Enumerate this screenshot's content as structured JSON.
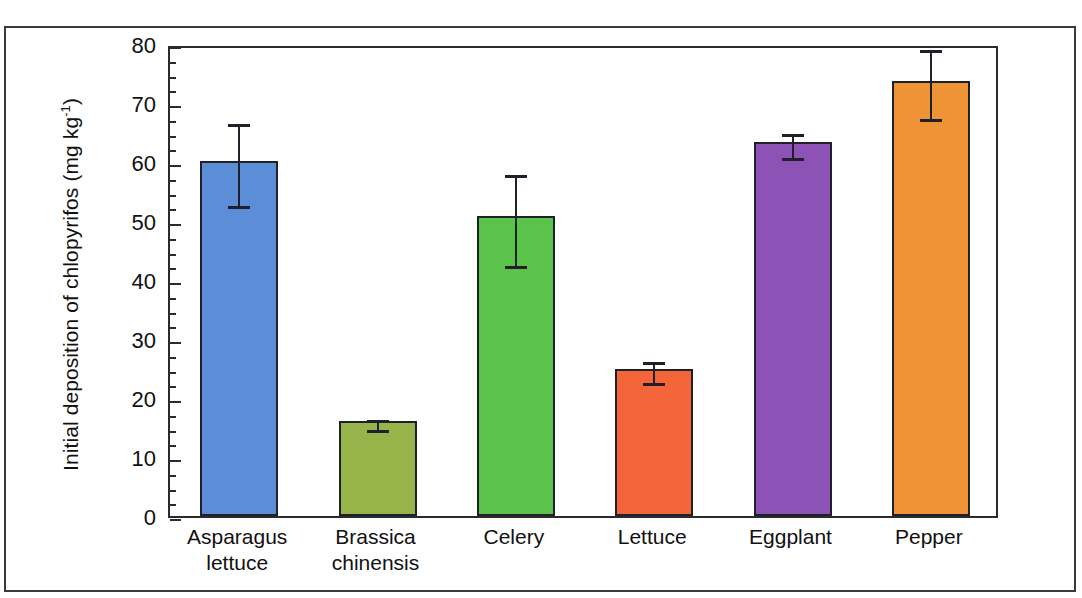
{
  "chart_data": {
    "type": "bar",
    "title": "",
    "xlabel": "",
    "ylabel": "Initial deposition of chlopyrifos (mg kg-1)",
    "ylabel_prefix": "Initial deposition of chlopyrifos (mg kg",
    "ylabel_sup": "-1",
    "ylabel_suffix": ")",
    "ylim": [
      0,
      80
    ],
    "ytick_step": 10,
    "yminor_step": 2.5,
    "grid": false,
    "legend": "none",
    "categories": [
      "Asparagus lettuce",
      "Brassica chinensis",
      "Celery",
      "Lettuce",
      "Eggplant",
      "Pepper"
    ],
    "category_lines": [
      [
        "Asparagus",
        "lettuce"
      ],
      [
        "Brassica",
        "chinensis"
      ],
      [
        "Celery",
        ""
      ],
      [
        "Lettuce",
        ""
      ],
      [
        "Eggplant",
        ""
      ],
      [
        "Pepper",
        ""
      ]
    ],
    "values": [
      60.2,
      16.1,
      50.8,
      25.0,
      63.4,
      73.8
    ],
    "errors": [
      7.0,
      0.8,
      7.7,
      1.7,
      2.0,
      5.8
    ],
    "colors": [
      "#5b8ed6",
      "#96b44a",
      "#5cc34a",
      "#f4663a",
      "#8d52b5",
      "#ef9436"
    ],
    "bar_edge_color": "#20202a",
    "axis_color": "#2b2b2b",
    "ytick_labels": [
      "0",
      "10",
      "20",
      "30",
      "40",
      "50",
      "60",
      "70",
      "80"
    ],
    "ytick_values": [
      0,
      10,
      20,
      30,
      40,
      50,
      60,
      70,
      80
    ]
  }
}
